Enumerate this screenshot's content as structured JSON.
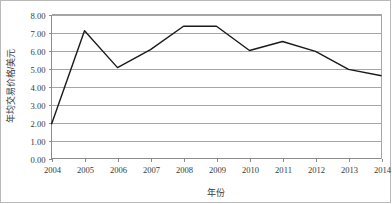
{
  "chart_data": {
    "type": "line",
    "title": "",
    "xlabel": "年份",
    "ylabel": "年均交易价格/美元",
    "categories": [
      "2004",
      "2005",
      "2006",
      "2007",
      "2008",
      "2009",
      "2010",
      "2011",
      "2012",
      "2013",
      "2014"
    ],
    "series": [
      {
        "name": "年均交易价格",
        "values": [
          1.9,
          7.1,
          5.05,
          6.05,
          7.35,
          7.35,
          6.0,
          6.5,
          5.95,
          4.95,
          4.6
        ]
      }
    ],
    "ylim": [
      0.0,
      8.0
    ],
    "ytick_step": 1.0,
    "ytick_labels": [
      "0.00",
      "1.00",
      "2.00",
      "3.00",
      "4.00",
      "5.00",
      "6.00",
      "7.00",
      "8.00"
    ],
    "xtick_labels": [
      "2004",
      "2005",
      "2006",
      "2007",
      "2008",
      "2009",
      "2010",
      "2011",
      "2012",
      "2013",
      "2014"
    ],
    "grid": "horizontal",
    "legend": "none",
    "line_color": "#1a1a1a",
    "grid_color": "#a6a6a6",
    "background_color": "#ffffff",
    "markers": false
  },
  "axes": {
    "y_label": "年均交易价格/美元",
    "x_label": "年份",
    "y_ticks": [
      {
        "label": "8.00",
        "value": 8.0
      },
      {
        "label": "7.00",
        "value": 7.0
      },
      {
        "label": "6.00",
        "value": 6.0
      },
      {
        "label": "5.00",
        "value": 5.0
      },
      {
        "label": "4.00",
        "value": 4.0
      },
      {
        "label": "3.00",
        "value": 3.0
      },
      {
        "label": "2.00",
        "value": 2.0
      },
      {
        "label": "1.00",
        "value": 1.0
      },
      {
        "label": "0.00",
        "value": 0.0
      }
    ],
    "x_ticks": [
      {
        "label": "2004",
        "value": 2004
      },
      {
        "label": "2005",
        "value": 2005
      },
      {
        "label": "2006",
        "value": 2006
      },
      {
        "label": "2007",
        "value": 2007
      },
      {
        "label": "2008",
        "value": 2008
      },
      {
        "label": "2009",
        "value": 2009
      },
      {
        "label": "2010",
        "value": 2010
      },
      {
        "label": "2011",
        "value": 2011
      },
      {
        "label": "2012",
        "value": 2012
      },
      {
        "label": "2013",
        "value": 2013
      },
      {
        "label": "2014",
        "value": 2014
      }
    ]
  }
}
